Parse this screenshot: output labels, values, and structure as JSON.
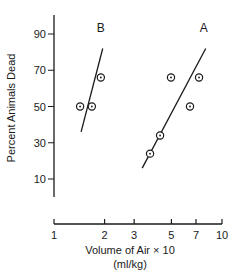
{
  "chart_data": {
    "type": "scatter",
    "title": "",
    "xlabel": "Volume of Air × 10",
    "xlabel_units": "(ml/kg)",
    "ylabel": "Percent Animals Dead",
    "xscale": "log",
    "xlim": [
      1,
      10
    ],
    "ylim": [
      0,
      100
    ],
    "x_ticks": [
      1,
      2,
      3,
      5,
      7,
      10
    ],
    "x_tick_labels": [
      "1",
      "2",
      "3",
      "5",
      "7",
      "10"
    ],
    "y_ticks": [
      10,
      30,
      50,
      70,
      90
    ],
    "y_tick_labels": [
      "10",
      "30",
      "50",
      "70",
      "90"
    ],
    "grid": false,
    "legend": "none (series labeled directly with letters above lines)",
    "series": [
      {
        "name": "B",
        "points": [
          {
            "x": 1.43,
            "y": 50
          },
          {
            "x": 1.68,
            "y": 50
          },
          {
            "x": 1.9,
            "y": 66
          }
        ],
        "fit_line": [
          {
            "x": 1.45,
            "y": 36
          },
          {
            "x": 1.95,
            "y": 82
          }
        ]
      },
      {
        "name": "A",
        "points": [
          {
            "x": 3.73,
            "y": 24
          },
          {
            "x": 4.28,
            "y": 34
          },
          {
            "x": 4.97,
            "y": 66
          },
          {
            "x": 6.45,
            "y": 50
          },
          {
            "x": 7.3,
            "y": 66
          }
        ],
        "fit_line": [
          {
            "x": 3.35,
            "y": 16
          },
          {
            "x": 8.0,
            "y": 82
          }
        ]
      }
    ]
  },
  "layout": {
    "plot": {
      "x_axis_left_px": 54,
      "x_axis_right_px": 222,
      "x_axis_y_px": 224,
      "y_axis_x_px": 54,
      "y_axis_top_px": 15,
      "y_axis_bottom_px": 197,
      "y90_px": 34,
      "y10_px": 179
    },
    "colors": {
      "ink": "#1a1a1a",
      "background": "#ffffff"
    }
  }
}
